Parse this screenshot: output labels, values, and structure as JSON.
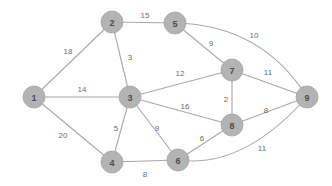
{
  "figure": {
    "width": 332,
    "height": 186,
    "background_color": "#ffffff",
    "node_fill_color": "#b3b3b3",
    "node_stroke_color": "#a6a6a6",
    "edge_color": "#a8a8a8",
    "node_label_color": "#4d4d4d",
    "edge_label_color": "#6b6b6b",
    "node_radius": 11
  },
  "graph_data": {
    "type": "node-link-diagram",
    "directed": false,
    "weighted": true,
    "node_count": 9,
    "edge_count": 16,
    "nodes": [
      {
        "id": "1",
        "label": "1",
        "x": 34,
        "y": 97
      },
      {
        "id": "2",
        "label": "2",
        "x": 112,
        "y": 22
      },
      {
        "id": "3",
        "label": "3",
        "x": 130,
        "y": 97
      },
      {
        "id": "4",
        "label": "4",
        "x": 112,
        "y": 162
      },
      {
        "id": "5",
        "label": "5",
        "x": 175,
        "y": 23
      },
      {
        "id": "6",
        "label": "6",
        "x": 178,
        "y": 160
      },
      {
        "id": "7",
        "label": "7",
        "x": 232,
        "y": 70
      },
      {
        "id": "8",
        "label": "8",
        "x": 232,
        "y": 125
      },
      {
        "id": "9",
        "label": "9",
        "x": 307,
        "y": 97
      }
    ],
    "edges": [
      {
        "source": "1",
        "target": "2",
        "weight": "18",
        "shape": "line",
        "label_x": 68,
        "label_y": 51
      },
      {
        "source": "1",
        "target": "3",
        "weight": "14",
        "shape": "line",
        "label_x": 82,
        "label_y": 89
      },
      {
        "source": "1",
        "target": "4",
        "weight": "20",
        "shape": "line",
        "label_x": 63,
        "label_y": 135
      },
      {
        "source": "2",
        "target": "5",
        "weight": "15",
        "shape": "line",
        "label_x": 145,
        "label_y": 15
      },
      {
        "source": "2",
        "target": "3",
        "weight": "3",
        "shape": "line",
        "label_x": 130,
        "label_y": 57
      },
      {
        "source": "3",
        "target": "7",
        "weight": "12",
        "shape": "line",
        "label_x": 180,
        "label_y": 73
      },
      {
        "source": "3",
        "target": "8",
        "weight": "16",
        "shape": "line",
        "label_x": 185,
        "label_y": 106
      },
      {
        "source": "3",
        "target": "4",
        "weight": "5",
        "shape": "line",
        "label_x": 116,
        "label_y": 128
      },
      {
        "source": "3",
        "target": "6",
        "weight": "9",
        "shape": "line",
        "label_x": 157,
        "label_y": 128
      },
      {
        "source": "4",
        "target": "6",
        "weight": "8",
        "shape": "line",
        "label_x": 145,
        "label_y": 174
      },
      {
        "source": "5",
        "target": "7",
        "weight": "9",
        "shape": "line",
        "label_x": 211,
        "label_y": 43
      },
      {
        "source": "5",
        "target": "9",
        "weight": "10",
        "shape": "curve",
        "curve_x": 262,
        "curve_y": 25,
        "label_x": 254,
        "label_y": 35
      },
      {
        "source": "7",
        "target": "9",
        "weight": "11",
        "shape": "line",
        "label_x": 268,
        "label_y": 72
      },
      {
        "source": "7",
        "target": "8",
        "weight": "2",
        "shape": "line",
        "label_x": 226,
        "label_y": 99
      },
      {
        "source": "8",
        "target": "9",
        "weight": "8",
        "shape": "line",
        "label_x": 266,
        "label_y": 110
      },
      {
        "source": "6",
        "target": "8",
        "weight": "6",
        "shape": "line",
        "label_x": 202,
        "label_y": 138
      },
      {
        "source": "6",
        "target": "9",
        "weight": "11",
        "shape": "curve",
        "curve_x": 243,
        "curve_y": 169,
        "label_x": 262,
        "label_y": 148
      }
    ]
  }
}
